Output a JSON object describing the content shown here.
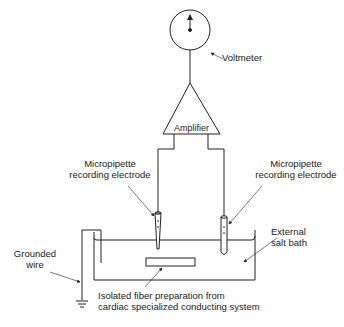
{
  "diagram": {
    "components": {
      "voltmeter": {
        "label": "Voltmeter"
      },
      "amplifier": {
        "label": "Amplifier"
      },
      "left_electrode": {
        "label_line1": "Micropipette",
        "label_line2": "recording electrode"
      },
      "right_electrode": {
        "label_line1": "Micropipette",
        "label_line2": "recording electrode"
      },
      "bath": {
        "label_line1": "External",
        "label_line2": "salt bath"
      },
      "ground": {
        "label_line1": "Grounded",
        "label_line2": "wire"
      },
      "fiber": {
        "label_line1": "Isolated fiber preparation from",
        "label_line2": "cardiac specialized conducting system"
      }
    },
    "colors": {
      "line": "#222222",
      "background": "#ffffff"
    }
  }
}
